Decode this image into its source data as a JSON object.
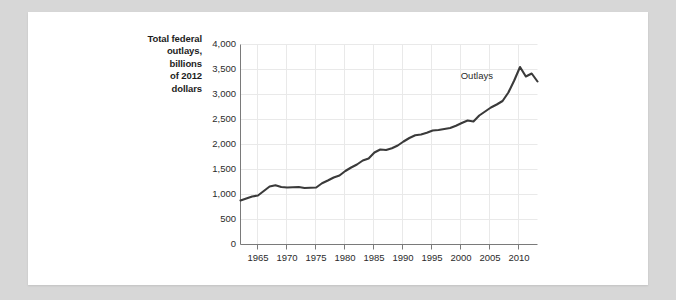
{
  "card": {
    "background": "#ffffff",
    "page_background": "#d7d7d7"
  },
  "chart_data": {
    "type": "line",
    "title": "",
    "subtitle": "",
    "axis_title": {
      "lines": [
        "Total federal",
        "outlays,",
        "billions",
        "of 2012",
        "dollars"
      ],
      "full": "Total federal outlays, billions of 2012 dollars"
    },
    "xlabel": "",
    "ylabel": "Total federal outlays, billions of 2012 dollars",
    "xlim": [
      1962,
      2013
    ],
    "ylim": [
      0,
      4000
    ],
    "yticks": [
      0,
      500,
      1000,
      1500,
      2000,
      2500,
      3000,
      3500,
      4000
    ],
    "ytick_labels": [
      "0",
      "500",
      "1,000",
      "1,500",
      "2,000",
      "2,500",
      "3,000",
      "3,500",
      "4,000"
    ],
    "xticks": [
      1965,
      1970,
      1975,
      1980,
      1985,
      1990,
      1995,
      2000,
      2005,
      2010
    ],
    "xtick_labels": [
      "1965",
      "1970",
      "1975",
      "1980",
      "1985",
      "1990",
      "1995",
      "2000",
      "2005",
      "2010"
    ],
    "grid": true,
    "grid_color": "#e9e9e9",
    "line_color": "#3a3a3a",
    "line_width": 2.1,
    "legend_position": "inline-annotation",
    "annotations": [
      {
        "text": "Outlays",
        "x": 2006.0,
        "y": 3380
      }
    ],
    "series": [
      {
        "name": "Outlays",
        "x": [
          1962,
          1963,
          1964,
          1965,
          1966,
          1967,
          1968,
          1969,
          1970,
          1971,
          1972,
          1973,
          1974,
          1975,
          1976,
          1977,
          1978,
          1979,
          1980,
          1981,
          1982,
          1983,
          1984,
          1985,
          1986,
          1987,
          1988,
          1989,
          1990,
          1991,
          1992,
          1993,
          1994,
          1995,
          1996,
          1997,
          1998,
          1999,
          2000,
          2001,
          2002,
          2003,
          2004,
          2005,
          2006,
          2007,
          2008,
          2009,
          2010,
          2011,
          2012,
          2013
        ],
        "values": [
          880,
          920,
          960,
          980,
          1070,
          1160,
          1185,
          1150,
          1140,
          1145,
          1150,
          1130,
          1135,
          1140,
          1225,
          1280,
          1340,
          1380,
          1470,
          1540,
          1600,
          1680,
          1720,
          1840,
          1900,
          1890,
          1925,
          1980,
          2060,
          2130,
          2185,
          2200,
          2235,
          2280,
          2290,
          2310,
          2330,
          2375,
          2430,
          2480,
          2460,
          2580,
          2660,
          2740,
          2800,
          2870,
          3040,
          3280,
          3550,
          3360,
          3420,
          3260
        ]
      }
    ]
  }
}
